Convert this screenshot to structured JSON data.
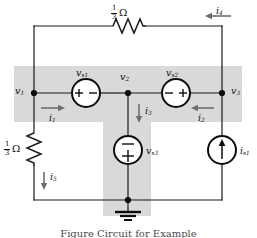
{
  "figure": {
    "type": "electrical-circuit-schematic",
    "caption": "Figure    Circuit for Example",
    "highlight_color": "#d9d9d9",
    "wire_color": "#1a1a1a",
    "background": "#ffffff"
  },
  "nodes": [
    {
      "id": "v1",
      "label": "v",
      "sub": "1",
      "x": 34,
      "y": 93
    },
    {
      "id": "v2",
      "label": "v",
      "sub": "2",
      "x": 128,
      "y": 93
    },
    {
      "id": "v3",
      "label": "v",
      "sub": "3",
      "x": 222,
      "y": 93
    },
    {
      "id": "gnd",
      "label": "",
      "sub": "",
      "x": 128,
      "y": 200
    }
  ],
  "node_labels": {
    "v1": {
      "text": "v",
      "sub": "1"
    },
    "v2": {
      "text": "v",
      "sub": "2"
    },
    "v3": {
      "text": "v",
      "sub": "3"
    }
  },
  "components": {
    "resistor_top": {
      "name": "resistor-top",
      "value_numerator": "1",
      "value_denominator": "3",
      "unit": "Ω",
      "orientation": "horizontal"
    },
    "resistor_left": {
      "name": "resistor-left",
      "value_numerator": "1",
      "value_denominator": "3",
      "unit": "Ω",
      "orientation": "vertical"
    },
    "vsource_1": {
      "name": "voltage-source-vs1",
      "label": "v",
      "sub": "s1",
      "polarity_left": "+",
      "polarity_right": "−",
      "orientation": "horizontal"
    },
    "vsource_2": {
      "name": "voltage-source-vs2",
      "label": "v",
      "sub": "s2",
      "polarity_left": "−",
      "polarity_right": "+",
      "orientation": "horizontal"
    },
    "vsource_3": {
      "name": "voltage-source-vs3",
      "label": "v",
      "sub": "s3",
      "polarity_top": "−",
      "polarity_bottom": "+",
      "orientation": "vertical"
    },
    "isource_1": {
      "name": "current-source-is1",
      "label": "i",
      "sub": "s1",
      "arrow_direction": "up",
      "orientation": "vertical"
    },
    "ground": {
      "name": "ground-symbol",
      "label": ""
    }
  },
  "currents": [
    {
      "id": "i1",
      "label": "i",
      "sub": "1",
      "direction": "right"
    },
    {
      "id": "i2",
      "label": "i",
      "sub": "2",
      "direction": "left"
    },
    {
      "id": "i3",
      "label": "i",
      "sub": "3",
      "direction": "down"
    },
    {
      "id": "i4",
      "label": "i",
      "sub": "4",
      "direction": "left"
    },
    {
      "id": "i5",
      "label": "i",
      "sub": "5",
      "direction": "down"
    }
  ]
}
